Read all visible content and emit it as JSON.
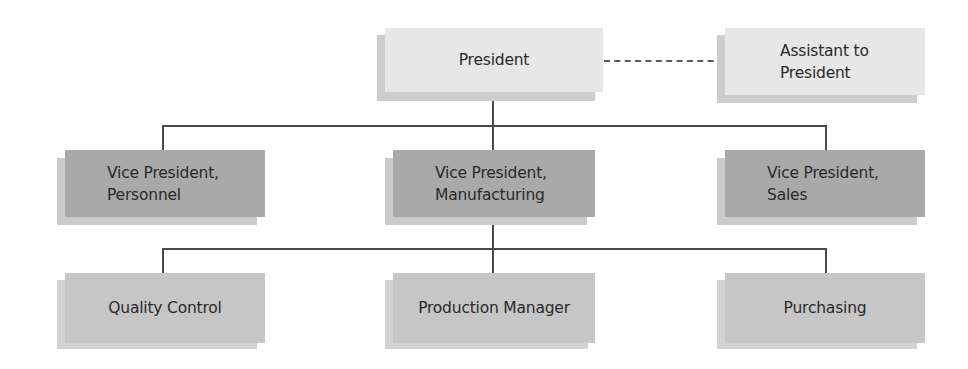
{
  "chart": {
    "colors": {
      "top_level_box": "#e7e7e7",
      "vice_president_box": "#a9a9a9",
      "department_box": "#c6c6c6",
      "connector_line": "#4a4a4a"
    },
    "nodes": {
      "president": {
        "label": "President",
        "level": 1
      },
      "assistant": {
        "label": "Assistant to\nPresident",
        "level": 1,
        "relation": "staff (dashed line) to President"
      },
      "vp_personnel": {
        "label": "Vice President,\nPersonnel",
        "level": 2,
        "reports_to": "President"
      },
      "vp_manufacturing": {
        "label": "Vice President,\nManufacturing",
        "level": 2,
        "reports_to": "President"
      },
      "vp_sales": {
        "label": "Vice President,\nSales",
        "level": 2,
        "reports_to": "President"
      },
      "quality_control": {
        "label": "Quality Control",
        "level": 3,
        "reports_to": "Vice President, Manufacturing"
      },
      "production_manager": {
        "label": "Production Manager",
        "level": 3,
        "reports_to": "Vice President, Manufacturing"
      },
      "purchasing": {
        "label": "Purchasing",
        "level": 3,
        "reports_to": "Vice President, Manufacturing"
      }
    }
  }
}
